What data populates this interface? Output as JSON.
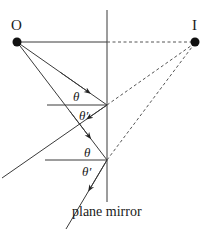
{
  "figure": {
    "type": "ray-diagram",
    "object_label": "O",
    "image_label": "I",
    "angle_incidence_label": "θ",
    "angle_reflection_label": "θ′",
    "mirror_label": "plane mirror",
    "colors": {
      "line": "#3a3a3a",
      "dashed": "#555555",
      "point": "#111111",
      "background": "#ffffff"
    },
    "elements": {
      "object_point": {
        "x": 17,
        "y": 42
      },
      "image_point": {
        "x": 195,
        "y": 42
      },
      "mirror": {
        "x": 107,
        "y1": 10,
        "y2": 200
      },
      "reflection_points": [
        {
          "x": 107,
          "y": 105
        },
        {
          "x": 107,
          "y": 160
        }
      ]
    }
  }
}
